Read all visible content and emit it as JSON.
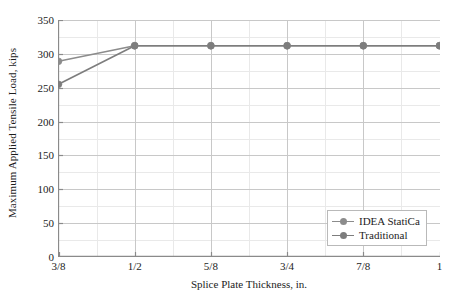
{
  "chart_data": {
    "type": "line",
    "title": "",
    "xlabel": "Splice Plate Thickness, in.",
    "ylabel": "Maximum Applied Tensile Load, kips",
    "categories": [
      "3/8",
      "1/2",
      "5/8",
      "3/4",
      "7/8",
      "1"
    ],
    "series": [
      {
        "name": "IDEA StatiCa",
        "color": "#8c8c8c",
        "values": [
          289,
          312,
          312,
          312,
          312,
          312
        ]
      },
      {
        "name": "Traditional",
        "color": "#7d7d7d",
        "values": [
          255,
          312,
          312,
          312,
          312,
          312
        ]
      }
    ],
    "ylim": [
      0,
      350
    ],
    "yticks": [
      0,
      50,
      100,
      150,
      200,
      250,
      300,
      350
    ],
    "ytick_labels": [
      "0",
      "50",
      "100",
      "150",
      "200",
      "250",
      "300",
      "350"
    ],
    "grid": true,
    "minor_grid": true,
    "legend_position": "lower right"
  },
  "legend": {
    "items": [
      {
        "label": "IDEA StatiCa"
      },
      {
        "label": "Traditional"
      }
    ]
  },
  "colors": {
    "axis": "#8a8a8a",
    "grid_major": "#c8c8c8",
    "grid_minor": "#e9e9e9",
    "series_1": "#8c8c8c",
    "series_2": "#7d7d7d",
    "text": "#1c1c1c",
    "background": "#ffffff",
    "legend_border": "#b9b9b9"
  }
}
